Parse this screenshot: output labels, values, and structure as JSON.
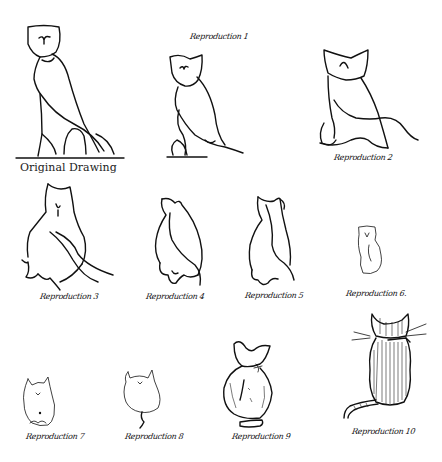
{
  "figure": {
    "panels": [
      {
        "id": "original",
        "label": "Original Drawing",
        "subject": "owl"
      },
      {
        "id": "r1",
        "label": "Reproduction 1",
        "subject": "owl"
      },
      {
        "id": "r2",
        "label": "Reproduction 2",
        "subject": "owl-cat"
      },
      {
        "id": "r3",
        "label": "Reproduction 3",
        "subject": "cat"
      },
      {
        "id": "r4",
        "label": "Reproduction 4",
        "subject": "cat"
      },
      {
        "id": "r5",
        "label": "Reproduction 5",
        "subject": "cat"
      },
      {
        "id": "r6",
        "label": "Reproduction 6.",
        "subject": "cat"
      },
      {
        "id": "r7",
        "label": "Reproduction 7",
        "subject": "cat"
      },
      {
        "id": "r8",
        "label": "Reproduction 8",
        "subject": "cat"
      },
      {
        "id": "r9",
        "label": "Reproduction 9",
        "subject": "cat"
      },
      {
        "id": "r10",
        "label": "Reproduction 10",
        "subject": "cat"
      }
    ]
  }
}
